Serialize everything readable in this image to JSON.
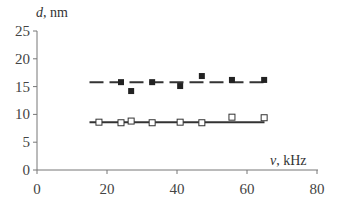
{
  "chart_data": {
    "type": "scatter",
    "title": "",
    "xlabel": "v, kHz",
    "ylabel": "d, nm",
    "xlim": [
      0,
      80
    ],
    "ylim": [
      0,
      25
    ],
    "x_ticks": [
      "0",
      "20",
      "40",
      "60",
      "80"
    ],
    "y_ticks": [
      "0",
      "5",
      "10",
      "15",
      "20",
      "25"
    ],
    "grid": false,
    "legend": null,
    "series": [
      {
        "name": "filled squares",
        "marker": "filled-square",
        "x": [
          24,
          26.9,
          32.9,
          40.9,
          47.1,
          55.7,
          64.9
        ],
        "y": [
          15.8,
          14.2,
          15.8,
          15.1,
          16.9,
          16.2,
          16.2
        ],
        "fit_line": {
          "style": "dashed",
          "y": 15.8,
          "x_range": [
            15,
            65
          ]
        }
      },
      {
        "name": "open squares",
        "marker": "open-square",
        "x": [
          17.7,
          24,
          26.9,
          32.9,
          40.9,
          47.1,
          55.7,
          64.9
        ],
        "y": [
          8.6,
          8.5,
          8.8,
          8.5,
          8.6,
          8.5,
          9.5,
          9.4
        ],
        "fit_line": {
          "style": "solid",
          "y": 8.6,
          "x_range": [
            15,
            65
          ]
        }
      }
    ]
  },
  "labels": {
    "ylabel_var": "d",
    "ylabel_unit": ", nm",
    "xlabel_var": "v",
    "xlabel_unit": ", kHz"
  }
}
